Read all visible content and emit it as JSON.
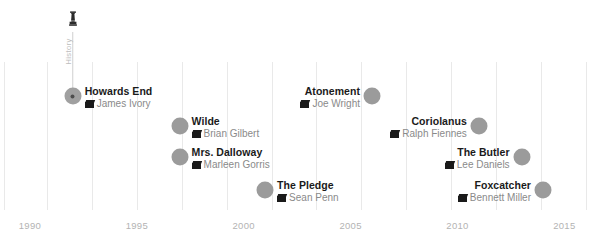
{
  "chart_data": {
    "type": "scatter",
    "title": "",
    "xlabel": "",
    "ylabel": "",
    "xlim": [
      1988.6,
      2016.2
    ],
    "grid": true,
    "legend": "none",
    "annotation": {
      "label": "History",
      "icon": "oscar-statuette-icon",
      "target_point": "Howards End",
      "target_year": 1992
    },
    "axis_ticks": [
      "1990",
      "1995",
      "2000",
      "2005",
      "2010",
      "2015"
    ],
    "gridline_years": [
      1988.8,
      1990.8,
      1992.9,
      1995,
      1997.1,
      1999.2,
      2001.3,
      2003.4,
      2005.5,
      2007.6,
      2009.7,
      2011.8,
      2013.9,
      2016
    ],
    "points": [
      {
        "title": "Howards End",
        "director": "James Ivory",
        "year": 1992,
        "row": 1,
        "side": "right",
        "selected": true
      },
      {
        "title": "Atonement",
        "director": "Joe Wright",
        "year": 2006,
        "row": 1,
        "side": "left",
        "selected": false
      },
      {
        "title": "Wilde",
        "director": "Brian Gilbert",
        "year": 1997,
        "row": 2,
        "side": "right",
        "selected": false
      },
      {
        "title": "Coriolanus",
        "director": "Ralph Fiennes",
        "year": 2011,
        "row": 2,
        "side": "left",
        "selected": false
      },
      {
        "title": "Mrs. Dalloway",
        "director": "Marleen Gorris",
        "year": 1997,
        "row": 3,
        "side": "right",
        "selected": false
      },
      {
        "title": "The Butler",
        "director": "Lee Daniels",
        "year": 2013,
        "row": 3,
        "side": "left",
        "selected": false
      },
      {
        "title": "The Pledge",
        "director": "Sean Penn",
        "year": 2001,
        "row": 4,
        "side": "right",
        "selected": false
      },
      {
        "title": "Foxcatcher",
        "director": "Bennett Miller",
        "year": 2014,
        "row": 4,
        "side": "left",
        "selected": false
      }
    ],
    "colors": {
      "point": "#9b9b9b",
      "point_core": "#4d4d4d",
      "title_text": "#1a1a1a",
      "director_text": "#8a8a8a",
      "gridline": "#e9e9e9",
      "tick_text": "#b3b3b3",
      "stem": "#cfcfcf",
      "annotation_text": "#bdbdbd",
      "background": "#ffffff"
    }
  }
}
